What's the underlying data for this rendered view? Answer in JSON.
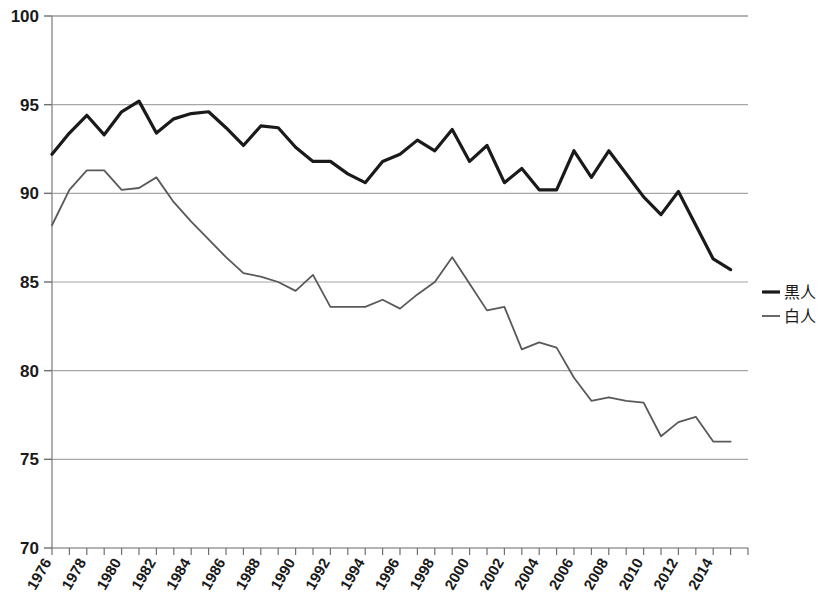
{
  "chart_data": {
    "type": "line",
    "title": "",
    "subtitle": "",
    "xlabel": "",
    "ylabel": "",
    "xlim": [
      1976,
      2016
    ],
    "ylim": [
      70,
      100
    ],
    "y_ticks": [
      70,
      75,
      80,
      85,
      90,
      95,
      100
    ],
    "y_tick_labels": [
      "70",
      "75",
      "80",
      "85",
      "90",
      "95",
      "100"
    ],
    "x_tick_labels": [
      "1976",
      "1978",
      "1980",
      "1982",
      "1984",
      "1986",
      "1988",
      "1990",
      "1992",
      "1994",
      "1996",
      "1998",
      "2000",
      "2002",
      "2004",
      "2006",
      "2008",
      "2010",
      "2012",
      "2014"
    ],
    "x_minor_tick_step": 1,
    "grid": "horizontal",
    "legend_position": "right",
    "x": [
      1976,
      1977,
      1978,
      1979,
      1980,
      1981,
      1982,
      1983,
      1984,
      1985,
      1986,
      1987,
      1988,
      1989,
      1990,
      1991,
      1992,
      1993,
      1994,
      1995,
      1996,
      1997,
      1998,
      1999,
      2000,
      2001,
      2002,
      2003,
      2004,
      2005,
      2006,
      2007,
      2008,
      2009,
      2010,
      2011,
      2012,
      2013,
      2014,
      2015
    ],
    "series": [
      {
        "name": "黒人",
        "color": "#1a1a1a",
        "line_width": 3.2,
        "values": [
          92.2,
          93.4,
          94.4,
          93.3,
          94.6,
          95.2,
          93.4,
          94.2,
          94.5,
          94.6,
          93.7,
          92.7,
          93.8,
          93.7,
          92.6,
          91.8,
          91.8,
          91.1,
          90.6,
          91.8,
          92.2,
          93.0,
          92.4,
          93.6,
          91.8,
          92.7,
          90.6,
          91.4,
          90.2,
          90.2,
          92.4,
          90.9,
          92.4,
          91.1,
          89.8,
          88.8,
          90.1,
          88.2,
          86.3,
          85.7
        ]
      },
      {
        "name": "白人",
        "color": "#595959",
        "line_width": 1.8,
        "values": [
          88.2,
          90.2,
          91.3,
          91.3,
          90.2,
          90.3,
          90.9,
          89.5,
          88.4,
          87.4,
          86.4,
          85.5,
          85.3,
          85.0,
          84.5,
          85.4,
          83.6,
          83.6,
          83.6,
          84.0,
          83.5,
          84.3,
          85.0,
          86.4,
          84.9,
          83.4,
          83.6,
          81.2,
          81.6,
          81.3,
          79.6,
          78.3,
          78.5,
          78.3,
          78.2,
          76.3,
          77.1,
          77.4,
          76.0,
          76.0
        ]
      }
    ]
  },
  "legend": {
    "items": [
      {
        "label": "黒人"
      },
      {
        "label": "白人"
      }
    ]
  }
}
